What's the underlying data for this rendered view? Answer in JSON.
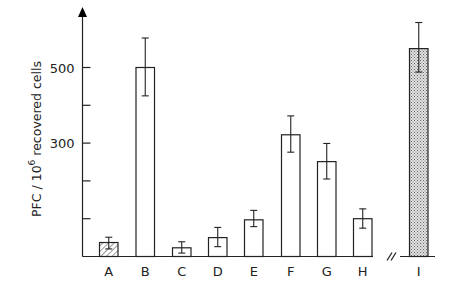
{
  "chart_data": {
    "type": "bar",
    "title": "",
    "xlabel": "",
    "ylabel": "PFC / 10^6 recovered cells",
    "ylabel_parts": {
      "prefix": "PFC / 10",
      "superscript": "6",
      "suffix": " recovered cells"
    },
    "ylim": [
      0,
      650
    ],
    "yticks": [
      100,
      200,
      300,
      400,
      500
    ],
    "ytick_labels": [
      {
        "value": 300,
        "label": "300"
      },
      {
        "value": 500,
        "label": "500"
      }
    ],
    "grid": false,
    "legend": null,
    "axis_break": {
      "after_category": "H",
      "symbol": "//"
    },
    "categories": [
      "A",
      "B",
      "C",
      "D",
      "E",
      "F",
      "G",
      "H",
      "I"
    ],
    "values": [
      37,
      500,
      23,
      50,
      97,
      322,
      251,
      100,
      550
    ],
    "error_low": [
      20,
      425,
      9,
      26,
      79,
      276,
      205,
      75,
      488
    ],
    "error_high": [
      51,
      578,
      39,
      77,
      122,
      372,
      299,
      126,
      619
    ],
    "fills": [
      "hatched",
      "open",
      "open",
      "open",
      "open",
      "open",
      "open",
      "open",
      "stippled"
    ]
  },
  "colors": {
    "ink": "#222222",
    "background": "#ffffff",
    "hatch": "#555555",
    "stipple": "#8a8a8a"
  }
}
